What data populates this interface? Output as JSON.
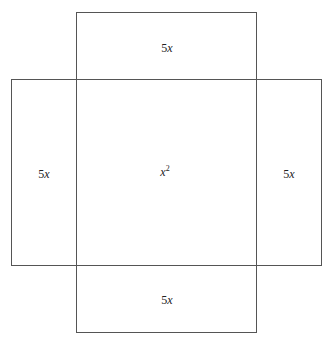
{
  "diagram": {
    "stroke_color": "#555555",
    "regions": {
      "top": {
        "coef": "5",
        "var": "x"
      },
      "left": {
        "coef": "5",
        "var": "x"
      },
      "center": {
        "var": "x",
        "exp": "2"
      },
      "right": {
        "coef": "5",
        "var": "x"
      },
      "bottom": {
        "coef": "5",
        "var": "x"
      }
    }
  }
}
